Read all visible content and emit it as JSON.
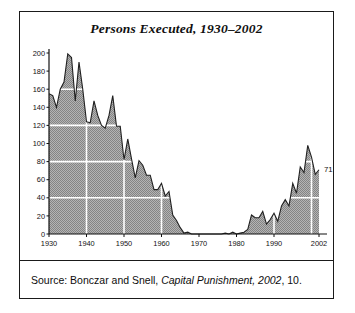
{
  "figure": {
    "title": "Persons Executed, 1930–2002",
    "source_prefix": "Source: Bonczar and Snell, ",
    "source_italic": "Capital Punishment, 2002",
    "source_suffix": ", 10."
  },
  "chart_data": {
    "type": "area",
    "title": "Persons Executed, 1930–2002",
    "xlabel": "",
    "ylabel": "",
    "xlim": [
      1930,
      2002
    ],
    "ylim": [
      0,
      200
    ],
    "grid": true,
    "grid_color": "#ffffff",
    "grid_y_values": [
      40,
      80,
      120,
      160
    ],
    "grid_x_values": [
      1940,
      1950,
      1960,
      1970,
      1980,
      1990,
      2000
    ],
    "legend": "none",
    "fill_color": "#a0a0a0",
    "line_color": "#202020",
    "xticks": [
      1930,
      1940,
      1950,
      1960,
      1970,
      1980,
      1990,
      2002
    ],
    "xticklabels": [
      "1930",
      "1940",
      "1950",
      "1960",
      "1970",
      "1980",
      "1990",
      "2002"
    ],
    "yticks": [
      0,
      20,
      40,
      60,
      80,
      100,
      120,
      140,
      160,
      180,
      200
    ],
    "yticklabels": [
      "0",
      "20",
      "40",
      "60",
      "80",
      "100",
      "120",
      "140",
      "160",
      "180",
      "200"
    ],
    "annotations": [
      {
        "text": "71",
        "x": 2002,
        "y": 71
      }
    ],
    "x": [
      1930,
      1931,
      1932,
      1933,
      1934,
      1935,
      1936,
      1937,
      1938,
      1939,
      1940,
      1941,
      1942,
      1943,
      1944,
      1945,
      1946,
      1947,
      1948,
      1949,
      1950,
      1951,
      1952,
      1953,
      1954,
      1955,
      1956,
      1957,
      1958,
      1959,
      1960,
      1961,
      1962,
      1963,
      1964,
      1965,
      1966,
      1967,
      1968,
      1969,
      1970,
      1971,
      1972,
      1973,
      1974,
      1975,
      1976,
      1977,
      1978,
      1979,
      1980,
      1981,
      1982,
      1983,
      1984,
      1985,
      1986,
      1987,
      1988,
      1989,
      1990,
      1991,
      1992,
      1993,
      1994,
      1995,
      1996,
      1997,
      1998,
      1999,
      2000,
      2001,
      2002
    ],
    "values": [
      155,
      153,
      140,
      160,
      168,
      199,
      195,
      147,
      190,
      160,
      124,
      123,
      147,
      131,
      120,
      117,
      131,
      153,
      119,
      119,
      82,
      105,
      83,
      62,
      81,
      76,
      65,
      65,
      49,
      49,
      56,
      42,
      47,
      21,
      15,
      7,
      1,
      2,
      0,
      0,
      0,
      0,
      0,
      0,
      0,
      0,
      0,
      1,
      0,
      2,
      0,
      1,
      2,
      5,
      21,
      18,
      18,
      25,
      11,
      16,
      23,
      14,
      31,
      38,
      31,
      56,
      45,
      74,
      68,
      98,
      85,
      66,
      71
    ],
    "series_name": "Persons executed"
  }
}
